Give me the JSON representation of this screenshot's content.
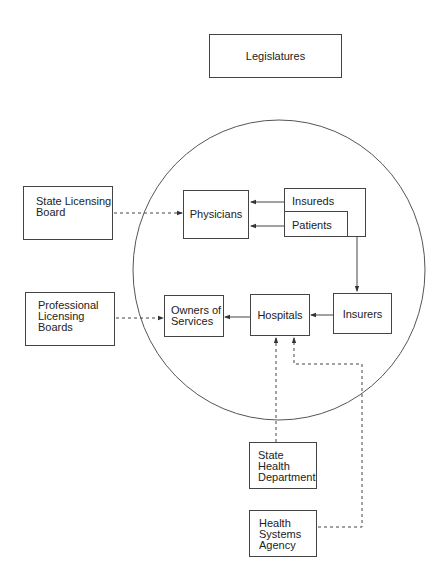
{
  "diagram": {
    "nodes": {
      "legislatures": "Legislatures",
      "state_licensing_board": "State Licensing\nBoard",
      "physicians": "Physicians",
      "insureds": "Insureds",
      "patients": "Patients",
      "professional_licensing_boards": "Professional\nLicensing\nBoards",
      "owners_of_services": "Owners of\nServices",
      "hospitals": "Hospitals",
      "insurers": "Insurers",
      "state_health_department": "State\nHealth\nDepartment",
      "health_systems_agency": "Health\nSystems\nAgency"
    },
    "edges": [
      {
        "from": "State Licensing Board",
        "to": "Physicians",
        "style": "dashed"
      },
      {
        "from": "Insureds",
        "to": "Physicians",
        "style": "solid"
      },
      {
        "from": "Patients",
        "to": "Physicians",
        "style": "solid"
      },
      {
        "from": "Insureds",
        "to": "Insurers",
        "style": "solid"
      },
      {
        "from": "Insurers",
        "to": "Hospitals",
        "style": "solid"
      },
      {
        "from": "Hospitals",
        "to": "Owners of Services",
        "style": "solid"
      },
      {
        "from": "Professional Licensing Boards",
        "to": "Owners of Services",
        "style": "dashed"
      },
      {
        "from": "State Health Department",
        "to": "Hospitals",
        "style": "dashed"
      },
      {
        "from": "Health Systems Agency",
        "to": "Hospitals",
        "style": "dashed"
      }
    ],
    "colors": {
      "line": "#444444",
      "background": "#ffffff"
    }
  }
}
